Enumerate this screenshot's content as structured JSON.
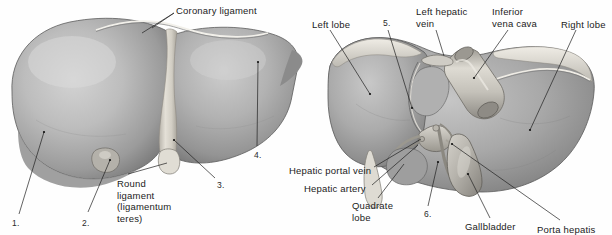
{
  "figure": {
    "background_color": "#fefefe",
    "text_color": "#1b1b1b",
    "organ_color": "#a9a9a9",
    "organ_highlight": "#cfcfcf",
    "organ_shadow": "#6f6f6f",
    "ligament_color": "#ddd9d0",
    "vessel_color": "#c2bfb8",
    "leader_color": "#1f1f1f"
  },
  "left_panel": {
    "name": "anterior-view",
    "labels": [
      {
        "id": "coronary-ligament",
        "text": "Coronary ligament",
        "x": 176,
        "y": 5,
        "interactable": false
      },
      {
        "id": "round-ligament",
        "text": "Round\nligament\n(ligamentum\nteres)",
        "x": 117,
        "y": 178,
        "interactable": false
      },
      {
        "id": "callout-1",
        "text": "1.",
        "x": 12,
        "y": 218,
        "interactable": false
      },
      {
        "id": "callout-2",
        "text": "2.",
        "x": 82,
        "y": 218,
        "interactable": false
      },
      {
        "id": "callout-3",
        "text": "3.",
        "x": 217,
        "y": 180,
        "interactable": false
      },
      {
        "id": "callout-4",
        "text": "4.",
        "x": 254,
        "y": 150,
        "interactable": false
      }
    ]
  },
  "right_panel": {
    "name": "posteroinferior-view",
    "labels": [
      {
        "id": "left-lobe",
        "text": "Left lobe",
        "x": 312,
        "y": 19,
        "interactable": false
      },
      {
        "id": "callout-5",
        "text": "5.",
        "x": 383,
        "y": 18,
        "interactable": false
      },
      {
        "id": "left-hepatic-vein",
        "text": "Left hepatic\nvein",
        "x": 416,
        "y": 6,
        "interactable": false
      },
      {
        "id": "inferior-vena-cava",
        "text": "Inferior\nvena cava",
        "x": 492,
        "y": 6,
        "interactable": false
      },
      {
        "id": "right-lobe",
        "text": "Right lobe",
        "x": 561,
        "y": 19,
        "interactable": false
      },
      {
        "id": "hepatic-portal-vein",
        "text": "Hepatic portal vein",
        "x": 289,
        "y": 165,
        "interactable": false
      },
      {
        "id": "hepatic-artery",
        "text": "Hepatic artery",
        "x": 304,
        "y": 183,
        "interactable": false
      },
      {
        "id": "quadrate-lobe",
        "text": "Quadrate\nlobe",
        "x": 352,
        "y": 200,
        "interactable": false
      },
      {
        "id": "callout-6",
        "text": "6.",
        "x": 424,
        "y": 209,
        "interactable": false
      },
      {
        "id": "gallbladder",
        "text": "Gallbladder",
        "x": 465,
        "y": 221,
        "interactable": false
      },
      {
        "id": "porta-hepatis",
        "text": "Porta hepatis",
        "x": 537,
        "y": 224,
        "interactable": false
      }
    ]
  }
}
